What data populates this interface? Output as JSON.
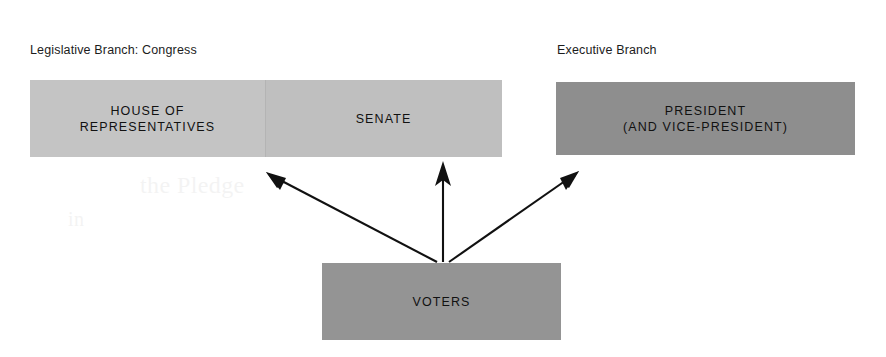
{
  "diagram": {
    "background_color": "#ffffff",
    "captions": {
      "legislative": "Legislative Branch: Congress",
      "executive": "Executive Branch"
    },
    "boxes": {
      "house": {
        "label": "HOUSE OF\nREPRESENTATIVES",
        "fill_color": "#c4c4c4"
      },
      "senate": {
        "label": "SENATE",
        "fill_color": "#bfbfbf"
      },
      "president": {
        "label": "PRESIDENT\n(AND VICE-PRESIDENT)",
        "fill_color": "#8e8e8e"
      },
      "voters": {
        "label": "VOTERS",
        "fill_color": "#949494"
      }
    },
    "arrows": [
      {
        "name": "voters-to-house",
        "from": "VOTERS",
        "to": "HOUSE OF REPRESENTATIVES",
        "color": "#111111"
      },
      {
        "name": "voters-to-senate",
        "from": "VOTERS",
        "to": "SENATE",
        "color": "#111111"
      },
      {
        "name": "voters-to-president",
        "from": "VOTERS",
        "to": "PRESIDENT",
        "color": "#111111"
      }
    ],
    "ghost_text": {
      "line1": "the Pledge",
      "line2": "in"
    }
  }
}
